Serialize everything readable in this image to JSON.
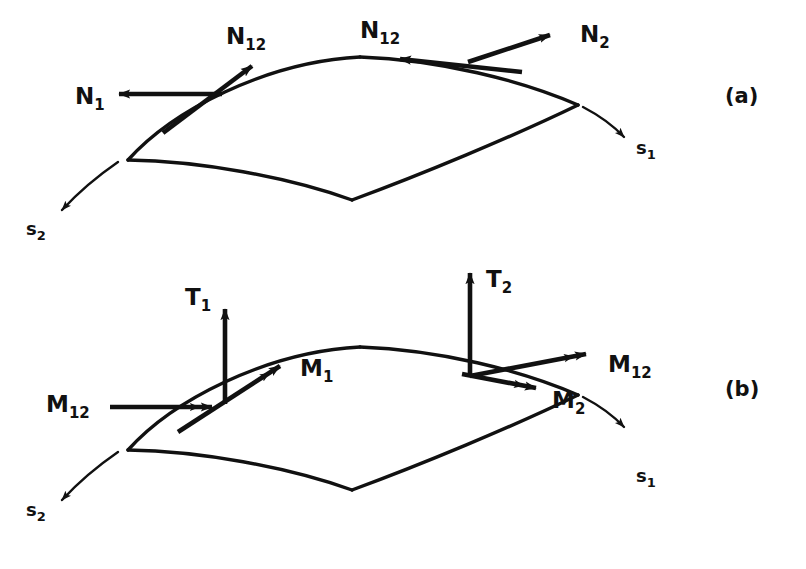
{
  "figure": {
    "background_color": "#ffffff",
    "ink_color": "#111111",
    "width": 806,
    "height": 569
  },
  "panels": [
    {
      "id": "panel-a",
      "label": "(a)",
      "label_x": 725,
      "label_y": 103,
      "description": "Membrane force resultants on a curved shell element",
      "vectors": [
        {
          "name": "N1",
          "base": "N",
          "subscript": "1",
          "kind": "force",
          "heads": 1,
          "label_x": 75,
          "label_y": 104,
          "shaft": [
            222,
            94,
            113,
            94
          ],
          "direction": "left"
        },
        {
          "name": "N12-left",
          "base": "N",
          "subscript": "12",
          "kind": "force",
          "heads": 1,
          "label_x": 226,
          "label_y": 44,
          "shaft": [
            163,
            133,
            260,
            60
          ],
          "direction": "up-right"
        },
        {
          "name": "N12-right",
          "base": "N",
          "subscript": "12",
          "kind": "force",
          "heads": 1,
          "label_x": 360,
          "label_y": 38,
          "shaft": [
            522,
            72,
            394,
            58
          ],
          "direction": "left"
        },
        {
          "name": "N2",
          "base": "N",
          "subscript": "2",
          "kind": "force",
          "heads": 1,
          "label_x": 580,
          "label_y": 42,
          "shaft": [
            468,
            62,
            557,
            32
          ],
          "direction": "up-right"
        }
      ],
      "axes": [
        {
          "name": "s1",
          "base": "s",
          "subscript": "1",
          "label_x": 636,
          "label_y": 154,
          "curve": [
            583,
            107,
            610,
            124,
            628,
            140
          ],
          "direction": "down-right"
        },
        {
          "name": "s2",
          "base": "s",
          "subscript": "2",
          "label_x": 26,
          "label_y": 235,
          "curve": [
            118,
            162,
            82,
            186,
            56,
            214
          ],
          "direction": "down-left"
        }
      ]
    },
    {
      "id": "panel-b",
      "label": "(b)",
      "label_x": 725,
      "label_y": 396,
      "description": "Bending, twisting moment and transverse shear resultants on a curved shell element",
      "vectors": [
        {
          "name": "M12-left",
          "base": "M",
          "subscript": "12",
          "kind": "moment",
          "heads": 2,
          "label_x": 46,
          "label_y": 412,
          "shaft": [
            110,
            407,
            224,
            407
          ],
          "direction": "right"
        },
        {
          "name": "T1",
          "base": "T",
          "subscript": "1",
          "kind": "shear",
          "heads": 1,
          "label_x": 185,
          "label_y": 305,
          "shaft": [
            225,
            404,
            225,
            301
          ],
          "direction": "up"
        },
        {
          "name": "M1",
          "base": "M",
          "subscript": "1",
          "kind": "moment",
          "heads": 2,
          "label_x": 300,
          "label_y": 376,
          "shaft": [
            178,
            432,
            290,
            359
          ],
          "direction": "up-right"
        },
        {
          "name": "T2",
          "base": "T",
          "subscript": "2",
          "kind": "shear",
          "heads": 1,
          "label_x": 486,
          "label_y": 287,
          "shaft": [
            470,
            377,
            470,
            265
          ],
          "direction": "up"
        },
        {
          "name": "M12-right",
          "base": "M",
          "subscript": "12",
          "kind": "moment",
          "heads": 2,
          "label_x": 608,
          "label_y": 372,
          "shaft": [
            470,
            376,
            598,
            352
          ],
          "direction": "right-up"
        },
        {
          "name": "M2",
          "base": "M",
          "subscript": "2",
          "kind": "moment",
          "heads": 2,
          "label_x": 552,
          "label_y": 408,
          "shaft": [
            462,
            374,
            548,
            390
          ],
          "direction": "right-down"
        }
      ],
      "axes": [
        {
          "name": "s1",
          "base": "s",
          "subscript": "1",
          "label_x": 636,
          "label_y": 482,
          "curve": [
            583,
            435,
            610,
            452,
            628,
            468
          ],
          "direction": "down-right"
        },
        {
          "name": "s2",
          "base": "s",
          "subscript": "2",
          "label_x": 26,
          "label_y": 516,
          "curve": [
            118,
            450,
            82,
            474,
            56,
            502
          ],
          "direction": "down-left"
        }
      ]
    }
  ],
  "shell_patch": {
    "description": "Doubly curved quadrilateral shell element, saddle-shaped",
    "corners": {
      "left": [
        128,
        160
      ],
      "top_apex": [
        360,
        57
      ],
      "right": [
        578,
        105
      ],
      "bottom": [
        352,
        200
      ]
    },
    "offset_panel_b_y": 290
  }
}
